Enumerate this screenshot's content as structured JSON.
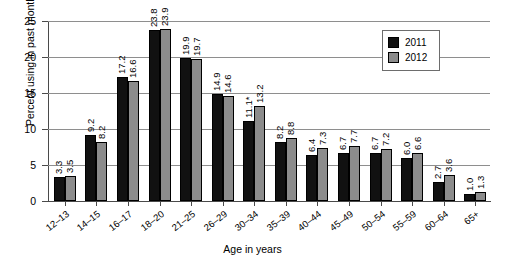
{
  "chart_data": {
    "type": "bar",
    "title": "",
    "subtitle": "",
    "xlabel": "Age in years",
    "ylabel": "Percent using in past month",
    "categories": [
      "12–13",
      "14–15",
      "16–17",
      "18–20",
      "21–25",
      "26–29",
      "30–34",
      "35–39",
      "40–44",
      "45–49",
      "50–54",
      "55–59",
      "60–64",
      "65+"
    ],
    "series": [
      {
        "name": "2011",
        "color": "#111111",
        "values": [
          3.3,
          9.2,
          17.2,
          23.8,
          19.9,
          14.9,
          11.1,
          8.2,
          6.4,
          6.7,
          6.7,
          6.0,
          2.7,
          1.0
        ],
        "labels": [
          "3.3",
          "9.2",
          "17.2",
          "23.8",
          "19.9",
          "14.9",
          "11.1*",
          "8.2",
          "6.4",
          "6.7",
          "6.7",
          "6.0",
          "2.7",
          "1.0"
        ]
      },
      {
        "name": "2012",
        "color": "#8c8c8c",
        "values": [
          3.5,
          8.2,
          16.6,
          23.9,
          19.7,
          14.6,
          13.2,
          8.8,
          7.3,
          7.7,
          7.2,
          6.6,
          3.6,
          1.3
        ],
        "labels": [
          "3.5",
          "8.2",
          "16.6",
          "23.9",
          "19.7",
          "14.6",
          "13.2",
          "8.8",
          "7.3",
          "7.7",
          "7.2",
          "6.6",
          "3.6",
          "1.3"
        ]
      }
    ],
    "ylim": [
      0,
      25
    ],
    "yticks": [
      0,
      5,
      10,
      15,
      20,
      25
    ],
    "ytick_labels": [
      "0",
      "5",
      "10",
      "15",
      "20",
      "25"
    ],
    "grid": true,
    "grid_axis": "y",
    "legend_position": "top-right",
    "annotations": [
      "* statistically significant difference marker on 2011 value for ages 30–34"
    ]
  },
  "legend": {
    "entries": [
      {
        "label": "2011",
        "color": "#111111"
      },
      {
        "label": "2012",
        "color": "#8c8c8c"
      }
    ]
  }
}
